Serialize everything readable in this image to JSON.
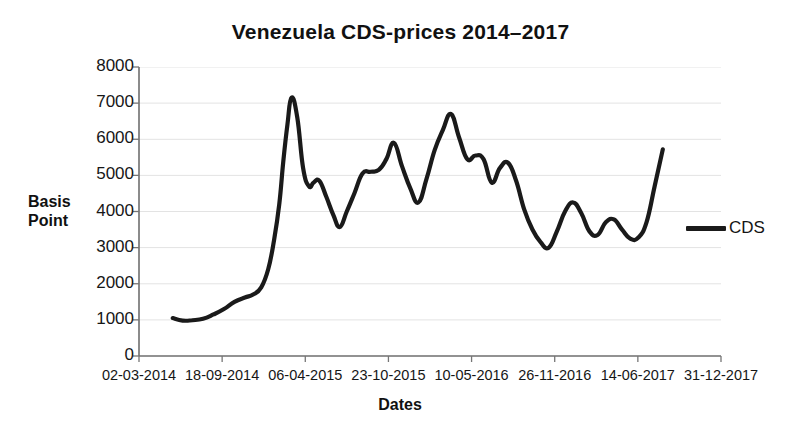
{
  "chart_data": {
    "type": "line",
    "title": "Venezuela CDS-prices 2014–2017",
    "xlabel": "Dates",
    "ylabel": "Basis Point",
    "ylabel_line1": "Basis",
    "ylabel_line2": "Point",
    "grid": true,
    "legend_position": "right",
    "line_color": "#1a1a1a",
    "ylim": [
      0,
      8000
    ],
    "yticks": [
      8000,
      7000,
      6000,
      5000,
      4000,
      3000,
      2000,
      1000,
      0
    ],
    "ytick_labels": [
      "8000",
      "7000",
      "6000",
      "5000",
      "4000",
      "3000",
      "2000",
      "1000",
      "0"
    ],
    "xtick_labels": [
      "02-03-2014",
      "18-09-2014",
      "06-04-2015",
      "23-10-2015",
      "10-05-2016",
      "26-11-2016",
      "14-06-2017",
      "31-12-2017"
    ],
    "xlim_labels": [
      "02-03-2014",
      "31-12-2017"
    ],
    "series": [
      {
        "name": "CDS",
        "color": "#1a1a1a",
        "x_fraction": [
          0.058,
          0.075,
          0.092,
          0.11,
          0.128,
          0.146,
          0.164,
          0.182,
          0.196,
          0.21,
          0.222,
          0.232,
          0.241,
          0.248,
          0.255,
          0.262,
          0.272,
          0.282,
          0.292,
          0.3,
          0.31,
          0.322,
          0.334,
          0.345,
          0.357,
          0.37,
          0.384,
          0.398,
          0.412,
          0.425,
          0.438,
          0.452,
          0.466,
          0.48,
          0.494,
          0.508,
          0.522,
          0.536,
          0.55,
          0.564,
          0.578,
          0.592,
          0.606,
          0.62,
          0.634,
          0.648,
          0.662,
          0.676,
          0.69,
          0.704,
          0.718,
          0.732,
          0.746,
          0.76,
          0.774,
          0.788,
          0.802,
          0.816,
          0.83,
          0.844,
          0.858,
          0.872,
          0.886,
          0.9
        ],
        "values": [
          1050,
          980,
          990,
          1030,
          1150,
          1300,
          1500,
          1620,
          1700,
          1900,
          2400,
          3200,
          4200,
          5400,
          6400,
          7150,
          6600,
          5200,
          4700,
          4800,
          4850,
          4400,
          3900,
          3570,
          4000,
          4500,
          5050,
          5100,
          5150,
          5450,
          5900,
          5250,
          4650,
          4250,
          4900,
          5700,
          6250,
          6700,
          6050,
          5450,
          5550,
          5450,
          4800,
          5200,
          5350,
          4850,
          4050,
          3500,
          3150,
          3000,
          3450,
          4000,
          4250,
          3950,
          3450,
          3350,
          3700,
          3780,
          3500,
          3250,
          3280,
          3700,
          4700,
          5720
        ]
      }
    ]
  },
  "legend": {
    "entries": [
      {
        "label": "CDS",
        "color": "#1a1a1a"
      }
    ]
  }
}
